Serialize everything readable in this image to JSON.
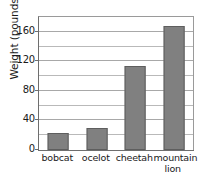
{
  "chart_data": {
    "type": "bar",
    "title": "",
    "xlabel": "",
    "ylabel": "Weight (pounds)",
    "categories": [
      "bobcat",
      "ocelot",
      "cheetah",
      "mountain lion"
    ],
    "values": [
      23,
      30,
      114,
      168
    ],
    "ylim": [
      0,
      180
    ],
    "ytick_labels": [
      "0",
      "40",
      "80",
      "120",
      "160"
    ],
    "ytick_values": [
      0,
      40,
      80,
      120,
      160
    ],
    "minor_gridline_values": [
      20,
      60,
      100,
      140
    ],
    "grid": true,
    "grid_orientation": "horizontal",
    "legend": null,
    "legend_position": "none",
    "bar_color": "#808080",
    "bar_edge_color": "#5e5e5e",
    "gridline_color": "#b9b9b9",
    "axis_color": "#6e6e6e",
    "background_color": "#ffffff"
  },
  "axis": {
    "y_title": "Weight (pounds)"
  },
  "categories": [
    {
      "label_line1": "bobcat",
      "label_line2": ""
    },
    {
      "label_line1": "ocelot",
      "label_line2": ""
    },
    {
      "label_line1": "cheetah",
      "label_line2": ""
    },
    {
      "label_line1": "mountain",
      "label_line2": "lion"
    }
  ],
  "clipped_caption": {
    "text": ""
  }
}
